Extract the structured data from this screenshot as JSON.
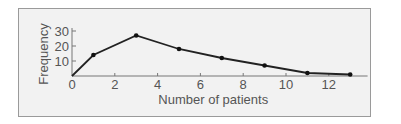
{
  "chart_data": {
    "type": "line",
    "title": "",
    "xlabel": "Number of patients",
    "ylabel": "Frequency",
    "x": [
      0,
      1,
      3,
      5,
      7,
      9,
      11,
      13
    ],
    "values": [
      0,
      14,
      27,
      18,
      12,
      7,
      2,
      1
    ],
    "xlim": [
      0,
      14
    ],
    "ylim": [
      0,
      30
    ],
    "xticks": [
      0,
      2,
      4,
      6,
      8,
      10,
      12
    ],
    "yticks": [
      10,
      20,
      30
    ],
    "grid": false,
    "legend": null,
    "colors": {
      "line": "#222222",
      "frame_bg": "#f2f2f2",
      "frame_border": "#9a9a9a",
      "text": "#555555"
    }
  }
}
